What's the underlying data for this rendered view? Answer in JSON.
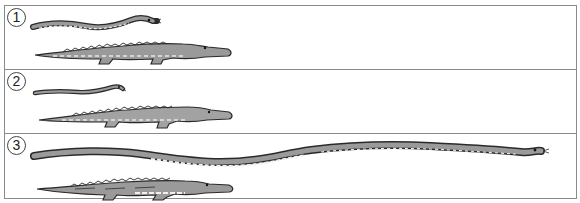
{
  "figure": {
    "panels": [
      {
        "label": "1",
        "snake": "medium snake",
        "crocodile": "crocodile"
      },
      {
        "label": "2",
        "snake": "short snake",
        "crocodile": "crocodile"
      },
      {
        "label": "3",
        "snake": "very long snake",
        "crocodile": "crocodile"
      }
    ]
  },
  "colors": {
    "border": "#8a8a8a",
    "animal_fill": "#9a9a9a",
    "animal_outline": "#2a2a2a",
    "belly": "#e8e8e8"
  }
}
